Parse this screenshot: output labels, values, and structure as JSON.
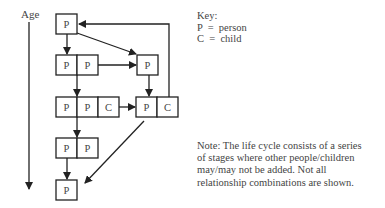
{
  "axis": {
    "label": "Age",
    "direction": "down"
  },
  "key": {
    "title": "Key:",
    "entries": [
      "P  =  person",
      "C  =  child"
    ]
  },
  "note": {
    "lines": [
      "Note: The life cycle consists of a series",
      "of stages where other people/children",
      "may/may not be added. Not all",
      "relationship combinations are shown."
    ]
  },
  "stages": [
    {
      "id": "s1",
      "cells": [
        "P"
      ]
    },
    {
      "id": "s2a",
      "cells": [
        "P",
        "P"
      ]
    },
    {
      "id": "s2b",
      "cells": [
        "P"
      ]
    },
    {
      "id": "s3a",
      "cells": [
        "P",
        "P",
        "C"
      ]
    },
    {
      "id": "s3b",
      "cells": [
        "P",
        "C"
      ]
    },
    {
      "id": "s4",
      "cells": [
        "P",
        "P"
      ]
    },
    {
      "id": "s5",
      "cells": [
        "P"
      ]
    }
  ],
  "edges": [
    [
      "s1",
      "s2a"
    ],
    [
      "s1",
      "s2b"
    ],
    [
      "s2a",
      "s2b"
    ],
    [
      "s2a",
      "s3a"
    ],
    [
      "s2b",
      "s3b"
    ],
    [
      "s3a",
      "s3b"
    ],
    [
      "s3b",
      "s1"
    ],
    [
      "s3a",
      "s4"
    ],
    [
      "s4",
      "s5"
    ],
    [
      "s3b",
      "s5"
    ]
  ]
}
